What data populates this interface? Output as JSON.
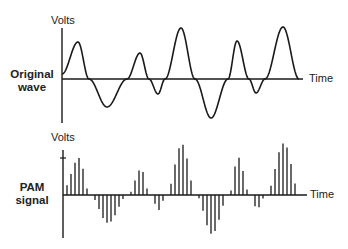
{
  "figure": {
    "panels": [
      {
        "id": "original",
        "label_lines": [
          "Original",
          "wave"
        ],
        "y_axis_label": "Volts",
        "x_axis_label": "Time",
        "style": "continuous"
      },
      {
        "id": "pam",
        "label_lines": [
          "PAM",
          "signal"
        ],
        "y_axis_label": "Volts",
        "x_axis_label": "Time",
        "style": "sampled-bars"
      }
    ],
    "colors": {
      "stroke": "#1a1a1a",
      "background": "#ffffff"
    }
  },
  "chart_data": {
    "type": "line",
    "title": "",
    "xlabel": "Time",
    "ylabel": "Volts",
    "grid": false,
    "note": "Waveform extrema (x in px along time axis, amplitude in px above axis; positive=up). PAM panel samples the same waveform every ~4px.",
    "series": [
      {
        "name": "Original wave",
        "points": [
          [
            0,
            5
          ],
          [
            16,
            37
          ],
          [
            27,
            0
          ],
          [
            45,
            -28
          ],
          [
            65,
            0
          ],
          [
            78,
            26
          ],
          [
            87,
            0
          ],
          [
            96,
            -15
          ],
          [
            103,
            0
          ],
          [
            119,
            51
          ],
          [
            133,
            0
          ],
          [
            149,
            -39
          ],
          [
            166,
            0
          ],
          [
            175,
            38
          ],
          [
            187,
            0
          ],
          [
            194,
            -14
          ],
          [
            203,
            0
          ],
          [
            221,
            52
          ],
          [
            237,
            0
          ]
        ]
      },
      {
        "name": "PAM signal",
        "sample_spacing_px": 4,
        "sample_start_px": 4,
        "source": "Original wave"
      }
    ]
  }
}
